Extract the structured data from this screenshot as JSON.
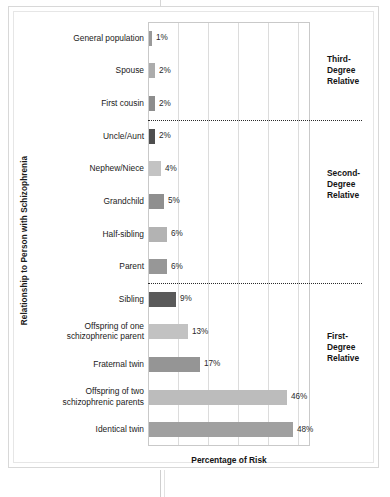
{
  "chart_data": {
    "type": "bar",
    "orientation": "horizontal",
    "title": "",
    "xlabel": "Percentage of Risk",
    "ylabel": "Relationship to Person with Schizophrenia",
    "xlim": [
      0,
      54
    ],
    "grid": true,
    "gridline_values": [
      10,
      20,
      30,
      40,
      50
    ],
    "legend": "none",
    "categories": [
      "General population",
      "Spouse",
      "First cousin",
      "Uncle/Aunt",
      "Nephew/Niece",
      "Grandchild",
      "Half-sibling",
      "Parent",
      "Sibling",
      "Offspring of one schizophrenic parent",
      "Fraternal twin",
      "Offspring of two schizophrenic parents",
      "Identical twin"
    ],
    "values": [
      1,
      2,
      2,
      2,
      4,
      5,
      6,
      6,
      9,
      13,
      17,
      46,
      48
    ],
    "value_labels": [
      "1%",
      "2%",
      "2%",
      "2%",
      "4%",
      "5%",
      "6%",
      "6%",
      "9%",
      "13%",
      "17%",
      "46%",
      "48%"
    ],
    "bar_colors": [
      "#9a9a9a",
      "#acacac",
      "#8d8d8d",
      "#4e4e4e",
      "#c3c3c3",
      "#8f8f8f",
      "#b3b3b3",
      "#979797",
      "#5a5a5a",
      "#c2c2c2",
      "#959595",
      "#bcbcbc",
      "#a0a0a0"
    ],
    "annotations": [
      {
        "label": "Third-Degree Relative",
        "lines": [
          "Third-",
          "Degree",
          "Relative"
        ],
        "group_start": 0,
        "group_end": 2
      },
      {
        "label": "Second-Degree Relative",
        "lines": [
          "Second-",
          "Degree",
          "Relative"
        ],
        "group_start": 3,
        "group_end": 6
      },
      {
        "label": "First-Degree Relative",
        "lines": [
          "First-",
          "Degree",
          "Relative"
        ],
        "group_start": 7,
        "group_end": 12
      }
    ],
    "separators_after_index": [
      2,
      7
    ]
  },
  "axis": {
    "y_title": "Relationship to Person with Schizophrenia",
    "x_title": "Percentage of Risk"
  },
  "labels": {
    "rows": [
      {
        "line1": "General population",
        "line2": ""
      },
      {
        "line1": "Spouse",
        "line2": ""
      },
      {
        "line1": "First cousin",
        "line2": ""
      },
      {
        "line1": "Uncle/Aunt",
        "line2": ""
      },
      {
        "line1": "Nephew/Niece",
        "line2": ""
      },
      {
        "line1": "Grandchild",
        "line2": ""
      },
      {
        "line1": "Half-sibling",
        "line2": ""
      },
      {
        "line1": "Parent",
        "line2": ""
      },
      {
        "line1": "Sibling",
        "line2": ""
      },
      {
        "line1": "Offspring of one",
        "line2": "schizophrenic parent"
      },
      {
        "line1": "Fraternal twin",
        "line2": ""
      },
      {
        "line1": "Offspring of two",
        "line2": "schizophrenic parents"
      },
      {
        "line1": "Identical twin",
        "line2": ""
      }
    ]
  },
  "groups": [
    {
      "l1": "Third-",
      "l2": "Degree",
      "l3": "Relative"
    },
    {
      "l1": "Second-",
      "l2": "Degree",
      "l3": "Relative"
    },
    {
      "l1": "First-",
      "l2": "Degree",
      "l3": "Relative"
    }
  ]
}
